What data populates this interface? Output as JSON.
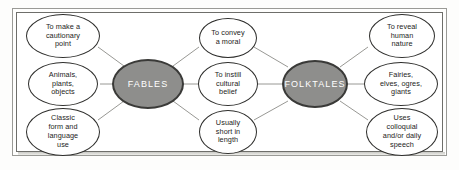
{
  "diagram": {
    "type": "concept-map",
    "title_visible": false,
    "background_color": "#ffffff",
    "frame_color": "#6e6e6a",
    "hub_fill_color": "#8e8e8c",
    "hub_border_color": "#3a3a38",
    "hub_text_color": "#ffffff",
    "leaf_fill_color": "#ffffff",
    "leaf_border_color": "#2e2e2c",
    "leaf_text_color": "#1d1d1b",
    "connector_color": "#8c8c88",
    "hubs": [
      {
        "id": "fables",
        "label": "FABLES"
      },
      {
        "id": "folktales",
        "label": "FOLKTALES"
      }
    ],
    "left_nodes": [
      {
        "id": "cautionary",
        "label": "To make a\ncautionary\npoint"
      },
      {
        "id": "animals",
        "label": "Animals,\nplants,\nobjects"
      },
      {
        "id": "classic-form",
        "label": "Classic\nform and\nlanguage\nuse"
      }
    ],
    "center_nodes": [
      {
        "id": "moral",
        "label": "To convey\na moral"
      },
      {
        "id": "cultural-belief",
        "label": "To instill\ncultural\nbelief"
      },
      {
        "id": "short-length",
        "label": "Usually\nshort in\nlength"
      }
    ],
    "right_nodes": [
      {
        "id": "human-nature",
        "label": "To reveal\nhuman\nnature"
      },
      {
        "id": "fairies",
        "label": "Fairies,\nelves, ogres,\ngiants"
      },
      {
        "id": "colloquial",
        "label": "Uses\ncolloquial\nand/or daily\nspeech"
      }
    ],
    "connections": [
      {
        "from": "cautionary",
        "to": "fables"
      },
      {
        "from": "animals",
        "to": "fables"
      },
      {
        "from": "classic-form",
        "to": "fables"
      },
      {
        "from": "fables",
        "to": "moral"
      },
      {
        "from": "fables",
        "to": "cultural-belief"
      },
      {
        "from": "fables",
        "to": "short-length"
      },
      {
        "from": "moral",
        "to": "folktales"
      },
      {
        "from": "cultural-belief",
        "to": "folktales"
      },
      {
        "from": "short-length",
        "to": "folktales"
      },
      {
        "from": "folktales",
        "to": "human-nature"
      },
      {
        "from": "folktales",
        "to": "fairies"
      },
      {
        "from": "folktales",
        "to": "colloquial"
      }
    ]
  }
}
